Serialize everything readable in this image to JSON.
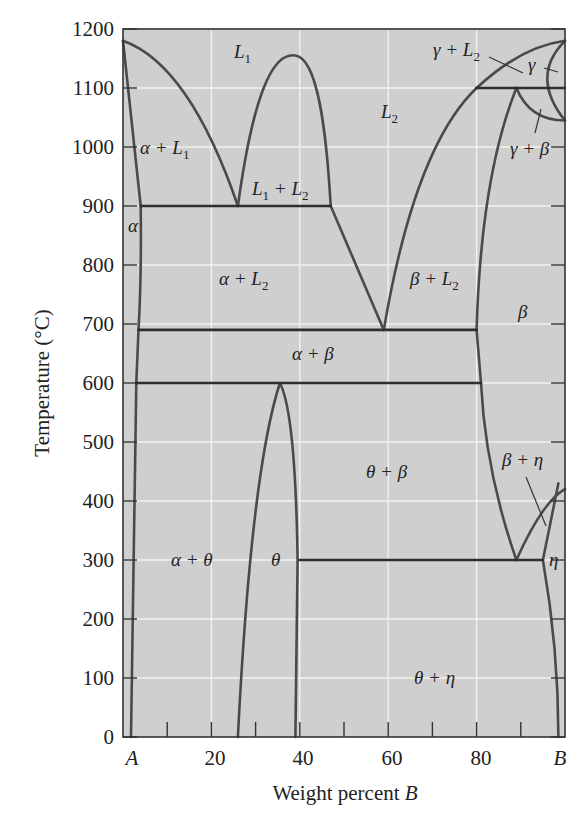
{
  "chart_data": {
    "type": "phase_diagram",
    "title": "",
    "xlabel": "Weight percent B",
    "ylabel": "Temperature (°C)",
    "xlim": [
      0,
      100
    ],
    "ylim": [
      0,
      1200
    ],
    "grid": true,
    "x_tick_labels": [
      {
        "value": 0,
        "label": "A",
        "italic": true
      },
      {
        "value": 20,
        "label": "20"
      },
      {
        "value": 40,
        "label": "40"
      },
      {
        "value": 60,
        "label": "60"
      },
      {
        "value": 80,
        "label": "80"
      },
      {
        "value": 100,
        "label": "B",
        "italic": true
      }
    ],
    "x_minor_ticks": [
      10,
      20,
      30,
      40,
      50,
      60,
      70,
      80,
      90
    ],
    "y_ticks": [
      0,
      100,
      200,
      300,
      400,
      500,
      600,
      700,
      800,
      900,
      1000,
      1100,
      1200
    ],
    "isotherms": [
      {
        "name": "monotectic",
        "temperature": 900,
        "x_from": 4,
        "x_to": 47
      },
      {
        "name": "eutectic-upper",
        "temperature": 690,
        "x_from": 3.5,
        "x_to": 80
      },
      {
        "name": "eutectoid-alpha-beta",
        "temperature": 600,
        "x_from": 3,
        "x_to": 81
      },
      {
        "name": "peritectic-gamma",
        "temperature": 1100,
        "x_from": 80,
        "x_to": 100
      },
      {
        "name": "eutectoid-eta",
        "temperature": 300,
        "x_from": 40,
        "x_to": 95
      }
    ],
    "special_points": [
      {
        "name": "A melting point",
        "x": 0,
        "y": 1180
      },
      {
        "name": "monotectic point",
        "x": 26,
        "y": 900
      },
      {
        "name": "L1+L2 critical point",
        "x": 39,
        "y": 1155
      },
      {
        "name": "eutectic point",
        "x": 59,
        "y": 690
      },
      {
        "name": "theta congruent max",
        "x": 35.5,
        "y": 600
      },
      {
        "name": "beta+eta eutectoid",
        "x": 89,
        "y": 300
      },
      {
        "name": "gamma peritectic",
        "x": 89,
        "y": 1100
      },
      {
        "name": "B melting point",
        "x": 100,
        "y": 1180
      }
    ],
    "phase_labels": [
      {
        "id": "L1",
        "text": "L",
        "sub": "1",
        "x": 27,
        "y": 1140
      },
      {
        "id": "L2",
        "text": "L",
        "sub": "2",
        "x": 62,
        "y": 1060
      },
      {
        "id": "alpha_L1",
        "text": "α + L",
        "sub": "1",
        "x": 5,
        "y": 1020
      },
      {
        "id": "L1_L2",
        "text": "L₁ + L₂",
        "x": 40,
        "y": 920
      },
      {
        "id": "alpha",
        "text": "α",
        "x": 1.2,
        "y": 840
      },
      {
        "id": "alpha_L2",
        "text": "α + L",
        "sub": "2",
        "x": 22,
        "y": 770
      },
      {
        "id": "beta_L2",
        "text": "β + L",
        "sub": "2",
        "x": 66,
        "y": 770
      },
      {
        "id": "beta",
        "text": "β",
        "x": 88,
        "y": 710
      },
      {
        "id": "alpha_beta",
        "text": "α + β",
        "x": 40,
        "y": 645
      },
      {
        "id": "theta_beta",
        "text": "θ + β",
        "x": 55,
        "y": 440
      },
      {
        "id": "beta_eta",
        "text": "β + η",
        "x": 88,
        "y": 450
      },
      {
        "id": "alpha_theta",
        "text": "α + θ",
        "x": 16,
        "y": 300
      },
      {
        "id": "theta",
        "text": "θ",
        "x": 34,
        "y": 300
      },
      {
        "id": "eta",
        "text": "η",
        "x": 97.5,
        "y": 300
      },
      {
        "id": "theta_eta",
        "text": "θ + η",
        "x": 70,
        "y": 100
      },
      {
        "id": "gamma_L2",
        "text": "γ + L",
        "sub": "2",
        "x": 80,
        "y": 1160
      },
      {
        "id": "gamma",
        "text": "γ",
        "x": 94.5,
        "y": 1130
      },
      {
        "id": "gamma_beta",
        "text": "γ + β",
        "x": 93,
        "y": 1015
      }
    ]
  },
  "axes": {
    "y_labels": [
      "0",
      "100",
      "200",
      "300",
      "400",
      "500",
      "600",
      "700",
      "800",
      "900",
      "1000",
      "1100",
      "1200"
    ],
    "x_labels": [
      "A",
      "20",
      "40",
      "60",
      "80",
      "B"
    ],
    "xlabel_main": "Weight percent ",
    "xlabel_var": "B",
    "ylabel": "Temperature (°C)"
  },
  "labels": {
    "L1": {
      "main": "L",
      "sub": "1"
    },
    "L2": {
      "main": "L",
      "sub": "2"
    },
    "alpha_L1": {
      "main": "α + L",
      "sub": "1"
    },
    "L1_L2_a": "L",
    "L1_L2_sub1": "1",
    "L1_L2_plus": " + L",
    "L1_L2_sub2": "2",
    "alpha": "α",
    "alpha_L2": {
      "main": "α + L",
      "sub": "2"
    },
    "beta_L2": {
      "main": "β + L",
      "sub": "2"
    },
    "beta": "β",
    "alpha_beta": "α + β",
    "theta_beta": "θ + β",
    "beta_eta": "β + η",
    "alpha_theta": "α + θ",
    "theta": "θ",
    "eta": "η",
    "theta_eta": "θ + η",
    "gamma_L2": {
      "main": "γ + L",
      "sub": "2"
    },
    "gamma": "γ",
    "gamma_beta": "γ + β"
  }
}
